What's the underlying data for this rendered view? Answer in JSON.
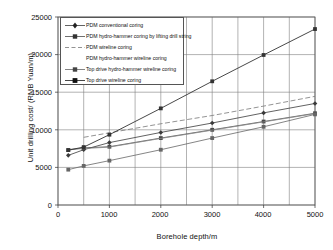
{
  "chart_data": {
    "type": "line",
    "title": "",
    "xlabel": "Borehole depth/m",
    "ylabel": "Unit drilling cost/ (RMB Yuan/m)",
    "xlim": [
      0,
      5000
    ],
    "ylim": [
      0,
      25000
    ],
    "xticks": [
      "0",
      "1000",
      "2000",
      "3000",
      "4000",
      "5000"
    ],
    "xtick_values": [
      0,
      1000,
      2000,
      3000,
      4000,
      5000
    ],
    "yticks": [
      "0",
      "5000",
      "10000",
      "15000",
      "20000",
      "25000"
    ],
    "ytick_values": [
      0,
      5000,
      10000,
      15000,
      20000,
      25000
    ],
    "grid": true,
    "legend_position": "upper-left-inside",
    "series": [
      {
        "name": "PDM conventional coring",
        "marker": "diamond",
        "line": "solid",
        "color": "#3a3a3a",
        "x": [
          200,
          500,
          1000,
          2000,
          3000,
          4000,
          5000
        ],
        "y": [
          6600,
          7350,
          8300,
          9650,
          10900,
          12250,
          13500
        ]
      },
      {
        "name": "PDM hydro-hammer coring by lifting drill string",
        "marker": "square",
        "line": "solid",
        "color": "#4a4a4a",
        "x": [
          200,
          500,
          1000,
          2000,
          3000,
          4000,
          5000
        ],
        "y": [
          7300,
          7600,
          7750,
          8900,
          10000,
          11100,
          12200
        ]
      },
      {
        "name": "PDM wireline coring",
        "marker": "none",
        "line": "dashed",
        "color": "#777777",
        "x": [
          500,
          1000,
          2000,
          3000,
          4000,
          5000
        ],
        "y": [
          9000,
          9600,
          10800,
          11900,
          13150,
          14450
        ]
      },
      {
        "name": "PDM hydro-hammer wireline coring",
        "marker": "none",
        "line": "solid",
        "color": "#8a8a8a",
        "x": [
          200,
          500,
          1000,
          2000,
          3000,
          4000,
          5000
        ],
        "y": [
          7400,
          7500,
          7700,
          8850,
          9950,
          11050,
          12150
        ]
      },
      {
        "name": "Top drive hydro-hammer wireline coring",
        "marker": "square",
        "line": "solid",
        "color": "#666666",
        "x": [
          200,
          500,
          1000,
          2000,
          3000,
          4000,
          5000
        ],
        "y": [
          4700,
          5200,
          5900,
          7350,
          8900,
          10400,
          12050
        ]
      },
      {
        "name": "Top drive wireline coring",
        "marker": "square",
        "line": "solid",
        "color": "#333333",
        "x": [
          200,
          500,
          1000,
          2000,
          3000,
          4000,
          5000
        ],
        "y": [
          7300,
          7700,
          9350,
          12850,
          16450,
          19950,
          23400
        ]
      }
    ]
  }
}
